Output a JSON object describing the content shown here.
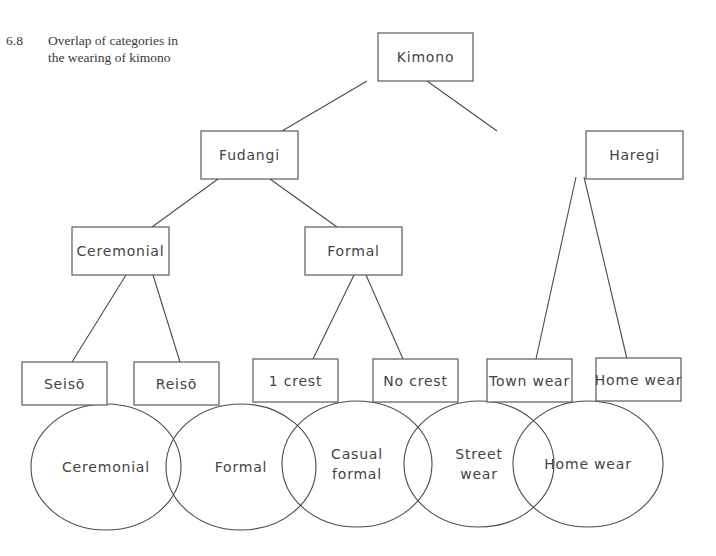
{
  "caption": {
    "number": "6.8",
    "text_line1": "Overlap of categories in",
    "text_line2": "the wearing of kimono"
  },
  "tree": {
    "root": {
      "label": "Kimono",
      "x": 378,
      "y": 33,
      "w": 95,
      "h": 48
    },
    "level1": [
      {
        "label": "Fudangi",
        "x": 201,
        "y": 131,
        "w": 97,
        "h": 48
      },
      {
        "label": "Haregi",
        "x": 586,
        "y": 131,
        "w": 97,
        "h": 48
      }
    ],
    "level2": [
      {
        "label": "Ceremonial",
        "x": 72,
        "y": 227,
        "w": 97,
        "h": 48
      },
      {
        "label": "Formal",
        "x": 305,
        "y": 227,
        "w": 97,
        "h": 48
      }
    ],
    "leaves": [
      {
        "label": "Seisō",
        "x": 22,
        "y": 362,
        "w": 85,
        "h": 43
      },
      {
        "label": "Reisō",
        "x": 134,
        "y": 362,
        "w": 85,
        "h": 43
      },
      {
        "label": "1 crest",
        "x": 253,
        "y": 359,
        "w": 85,
        "h": 43
      },
      {
        "label": "No crest",
        "x": 373,
        "y": 359,
        "w": 85,
        "h": 43
      },
      {
        "label": "Town wear",
        "x": 487,
        "y": 359,
        "w": 85,
        "h": 43
      },
      {
        "label": "Home wear",
        "x": 596,
        "y": 358,
        "w": 85,
        "h": 43
      }
    ],
    "connectors": [
      {
        "x1": 427,
        "y1": 81,
        "x2": 497,
        "y2": 131
      },
      {
        "x1": 367,
        "y1": 81,
        "x2": 282,
        "y2": 131
      },
      {
        "x1": 218,
        "y1": 179,
        "x2": 152,
        "y2": 227
      },
      {
        "x1": 270,
        "y1": 179,
        "x2": 337,
        "y2": 227
      },
      {
        "x1": 126,
        "y1": 275,
        "x2": 72,
        "y2": 362
      },
      {
        "x1": 153,
        "y1": 275,
        "x2": 180,
        "y2": 362
      },
      {
        "x1": 354,
        "y1": 275,
        "x2": 313,
        "y2": 359
      },
      {
        "x1": 366,
        "y1": 275,
        "x2": 403,
        "y2": 359
      },
      {
        "x1": 576,
        "y1": 177,
        "x2": 536,
        "y2": 359
      },
      {
        "x1": 584,
        "y1": 177,
        "x2": 627,
        "y2": 359
      }
    ]
  },
  "venn": {
    "ellipses": [
      {
        "label_line1": "Ceremonial",
        "label_line2": "",
        "cx": 106,
        "cy": 467,
        "rx": 75,
        "ry": 63
      },
      {
        "label_line1": "Formal",
        "label_line2": "",
        "cx": 241,
        "cy": 467,
        "rx": 75,
        "ry": 63
      },
      {
        "label_line1": "Casual",
        "label_line2": "formal",
        "cx": 357,
        "cy": 464,
        "rx": 75,
        "ry": 63
      },
      {
        "label_line1": "Street",
        "label_line2": "wear",
        "cx": 479,
        "cy": 464,
        "rx": 75,
        "ry": 63
      },
      {
        "label_line1": "Home wear",
        "label_line2": "",
        "cx": 588,
        "cy": 464,
        "rx": 75,
        "ry": 63
      }
    ]
  },
  "colors": {
    "stroke": "#4a4a4a",
    "text": "#444444",
    "background": "#ffffff"
  }
}
